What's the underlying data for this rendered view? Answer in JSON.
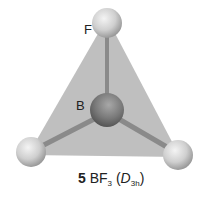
{
  "molecule": {
    "number": "5",
    "formula_base": "BF",
    "formula_sub": "3",
    "point_group_letter": "D",
    "point_group_sub": "3h",
    "open_paren": "(",
    "close_paren": ")"
  },
  "atoms": {
    "top_label": "F",
    "center_label": "B"
  },
  "colors": {
    "plane": "#b5b5b5",
    "boron": "#7a7a7a",
    "fluorine": "#d8d8d8",
    "bond": "#8a8a8a"
  }
}
